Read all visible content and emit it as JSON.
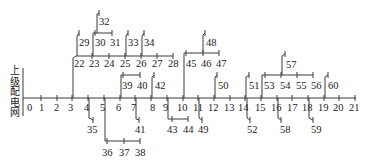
{
  "diagram": {
    "type": "radial distribution network single-line diagram",
    "source_label_chars": [
      "上",
      "级",
      "配",
      "电",
      "网"
    ],
    "source_label": "上级配电网",
    "line_color": "#3a3a3a",
    "main_feeder": {
      "y": 98,
      "nodes": [
        {
          "id": "0",
          "x": 26
        },
        {
          "id": "1",
          "x": 41
        },
        {
          "id": "2",
          "x": 57
        },
        {
          "id": "3",
          "x": 72
        },
        {
          "id": "4",
          "x": 88
        },
        {
          "id": "5",
          "x": 104
        },
        {
          "id": "6",
          "x": 120
        },
        {
          "id": "7",
          "x": 135
        },
        {
          "id": "8",
          "x": 151
        },
        {
          "id": "9",
          "x": 167
        },
        {
          "id": "10",
          "x": 183
        },
        {
          "id": "11",
          "x": 198
        },
        {
          "id": "12",
          "x": 214
        },
        {
          "id": "13",
          "x": 230
        },
        {
          "id": "14",
          "x": 245
        },
        {
          "id": "15",
          "x": 261
        },
        {
          "id": "16",
          "x": 277
        },
        {
          "id": "17",
          "x": 292
        },
        {
          "id": "18",
          "x": 308
        },
        {
          "id": "19",
          "x": 324
        },
        {
          "id": "20",
          "x": 339
        },
        {
          "id": "21",
          "x": 355
        }
      ]
    },
    "nodes": [
      {
        "id": "22",
        "x": 76,
        "y": 56
      },
      {
        "id": "23",
        "x": 92,
        "y": 56
      },
      {
        "id": "24",
        "x": 109,
        "y": 56
      },
      {
        "id": "25",
        "x": 125,
        "y": 56
      },
      {
        "id": "26",
        "x": 141,
        "y": 56
      },
      {
        "id": "27",
        "x": 157,
        "y": 56
      },
      {
        "id": "28",
        "x": 173,
        "y": 56
      },
      {
        "id": "29",
        "x": 79,
        "y": 33
      },
      {
        "id": "30",
        "x": 95,
        "y": 33
      },
      {
        "id": "31",
        "x": 112,
        "y": 33
      },
      {
        "id": "32",
        "x": 99,
        "y": 13
      },
      {
        "id": "33",
        "x": 128,
        "y": 33
      },
      {
        "id": "34",
        "x": 144,
        "y": 33
      },
      {
        "id": "35",
        "x": 93,
        "y": 120
      },
      {
        "id": "36",
        "x": 107,
        "y": 141
      },
      {
        "id": "37",
        "x": 124,
        "y": 141
      },
      {
        "id": "38",
        "x": 140,
        "y": 141
      },
      {
        "id": "39",
        "x": 123,
        "y": 75
      },
      {
        "id": "40",
        "x": 140,
        "y": 75
      },
      {
        "id": "41",
        "x": 139,
        "y": 120
      },
      {
        "id": "42",
        "x": 154,
        "y": 75
      },
      {
        "id": "43",
        "x": 172,
        "y": 119
      },
      {
        "id": "44",
        "x": 188,
        "y": 119
      },
      {
        "id": "45",
        "x": 186,
        "y": 53
      },
      {
        "id": "46",
        "x": 203,
        "y": 53
      },
      {
        "id": "47",
        "x": 219,
        "y": 53
      },
      {
        "id": "48",
        "x": 205,
        "y": 33
      },
      {
        "id": "49",
        "x": 202,
        "y": 120
      },
      {
        "id": "50",
        "x": 216,
        "y": 75
      },
      {
        "id": "51",
        "x": 248,
        "y": 75
      },
      {
        "id": "52",
        "x": 249,
        "y": 120
      },
      {
        "id": "53",
        "x": 264,
        "y": 75
      },
      {
        "id": "54",
        "x": 281,
        "y": 75
      },
      {
        "id": "55",
        "x": 297,
        "y": 75
      },
      {
        "id": "56",
        "x": 313,
        "y": 75
      },
      {
        "id": "57",
        "x": 284,
        "y": 55
      },
      {
        "id": "58",
        "x": 281,
        "y": 120
      },
      {
        "id": "59",
        "x": 313,
        "y": 120
      },
      {
        "id": "60",
        "x": 327,
        "y": 75
      }
    ],
    "branches": [
      {
        "from": "3",
        "path": "22-28",
        "dir": "up"
      },
      {
        "from": "22",
        "to": "29",
        "dir": "up"
      },
      {
        "from": "23",
        "path": "30-31",
        "dir": "up"
      },
      {
        "from": "30",
        "to": "32",
        "dir": "up"
      },
      {
        "from": "25",
        "to": "33",
        "dir": "up"
      },
      {
        "from": "26",
        "to": "34",
        "dir": "up"
      },
      {
        "from": "4",
        "to": "35",
        "dir": "down"
      },
      {
        "from": "5",
        "path": "36-38",
        "dir": "down"
      },
      {
        "from": "6",
        "path": "39-40",
        "dir": "up"
      },
      {
        "from": "7",
        "to": "41",
        "dir": "down"
      },
      {
        "from": "8",
        "to": "42",
        "dir": "up"
      },
      {
        "from": "9",
        "path": "43-44",
        "dir": "down"
      },
      {
        "from": "10",
        "path": "45-47",
        "dir": "up"
      },
      {
        "from": "46",
        "to": "48",
        "dir": "up"
      },
      {
        "from": "11",
        "to": "49",
        "dir": "down"
      },
      {
        "from": "12",
        "to": "50",
        "dir": "up"
      },
      {
        "from": "14",
        "to": "51",
        "dir": "up"
      },
      {
        "from": "14",
        "to": "52",
        "dir": "down"
      },
      {
        "from": "15",
        "path": "53-56",
        "dir": "up"
      },
      {
        "from": "54",
        "to": "57",
        "dir": "up"
      },
      {
        "from": "16",
        "to": "58",
        "dir": "down"
      },
      {
        "from": "18",
        "to": "59",
        "dir": "down"
      },
      {
        "from": "19",
        "to": "60",
        "dir": "up"
      }
    ]
  }
}
